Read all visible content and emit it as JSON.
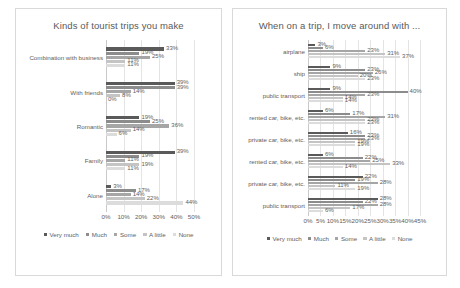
{
  "series_names": [
    "Very much",
    "Much",
    "Some",
    "A little",
    "None"
  ],
  "series_colors": [
    "#5a5a5a",
    "#8c8c8c",
    "#a6a6a6",
    "#c4c4c4",
    "#dcdcdc"
  ],
  "left_panel": {
    "title": "Kinds of tourist trips you make",
    "axis_ticks": [
      "0%",
      "10%",
      "20%",
      "30%",
      "40%",
      "50%"
    ]
  },
  "right_panel": {
    "title": "When on a trip, I move around with ...",
    "axis_ticks": [
      "0%",
      "5%",
      "10%",
      "15%",
      "20%",
      "25%",
      "30%",
      "35%",
      "40%",
      "45%"
    ]
  },
  "chart_data": [
    {
      "type": "bar",
      "title": "Kinds of tourist trips you make",
      "orientation": "horizontal",
      "xlabel": "",
      "ylabel": "",
      "xlim": [
        0,
        50
      ],
      "xtick_step": 10,
      "grid": true,
      "legend": "bottom",
      "legend_entries": [
        "Very much",
        "Much",
        "Some",
        "A little",
        "None"
      ],
      "categories": [
        "Combination with business",
        "With friends",
        "Romantic",
        "Family",
        "Alone"
      ],
      "series": [
        {
          "name": "Very much",
          "values": [
            33,
            39,
            19,
            39,
            3
          ]
        },
        {
          "name": "Much",
          "values": [
            19,
            39,
            25,
            19,
            17
          ]
        },
        {
          "name": "Some",
          "values": [
            25,
            14,
            36,
            11,
            14
          ]
        },
        {
          "name": "A little",
          "values": [
            11,
            8,
            14,
            19,
            22
          ]
        },
        {
          "name": "None",
          "values": [
            11,
            0,
            6,
            11,
            44
          ]
        }
      ],
      "value_labels": [
        [
          "33%",
          "19%",
          "25%",
          "11%",
          "11%"
        ],
        [
          "39%",
          "39%",
          "14%",
          "8%",
          "0%"
        ],
        [
          "19%",
          "25%",
          "36%",
          "14%",
          "6%"
        ],
        [
          "39%",
          "19%",
          "11%",
          "19%",
          "11%"
        ],
        [
          "3%",
          "17%",
          "14%",
          "22%",
          "44%"
        ]
      ]
    },
    {
      "type": "bar",
      "title": "When on a trip, I move around with ...",
      "orientation": "horizontal",
      "xlabel": "",
      "ylabel": "",
      "xlim": [
        0,
        45
      ],
      "xtick_step": 5,
      "grid": true,
      "legend": "bottom",
      "legend_entries": [
        "Very much",
        "Much",
        "Some",
        "A little",
        "None"
      ],
      "categories": [
        "airplane",
        "ship",
        "public transport",
        "rented car, bike, etc.",
        "private car, bike, etc.",
        "rented car, bike, etc.",
        "private car, bike, etc.",
        "public transport"
      ],
      "series": [
        {
          "name": "Very much",
          "values": [
            3,
            9,
            9,
            6,
            16,
            6,
            22,
            28
          ]
        },
        {
          "name": "Much",
          "values": [
            6,
            23,
            40,
            17,
            23,
            22,
            19,
            22
          ]
        },
        {
          "name": "Some",
          "values": [
            23,
            26,
            23,
            31,
            23,
            25,
            28,
            28
          ]
        },
        {
          "name": "A little",
          "values": [
            31,
            20,
            14,
            23,
            19,
            33,
            11,
            17
          ]
        },
        {
          "name": "None",
          "values": [
            37,
            23,
            14,
            23,
            19,
            14,
            19,
            6
          ]
        }
      ],
      "value_labels": [
        [
          "3%",
          "6%",
          "23%",
          "31%",
          "37%"
        ],
        [
          "9%",
          "23%",
          "26%",
          "20%",
          "23%"
        ],
        [
          "9%",
          "40%",
          "23%",
          "14%",
          "14%"
        ],
        [
          "6%",
          "17%",
          "31%",
          "23%",
          "23%"
        ],
        [
          "16%",
          "23%",
          "23%",
          "19%",
          "19%"
        ],
        [
          "6%",
          "22%",
          "25%",
          "33%",
          "14%"
        ],
        [
          "22%",
          "19%",
          "28%",
          "11%",
          "19%"
        ],
        [
          "28%",
          "22%",
          "28%",
          "17%",
          "6%"
        ]
      ]
    }
  ]
}
